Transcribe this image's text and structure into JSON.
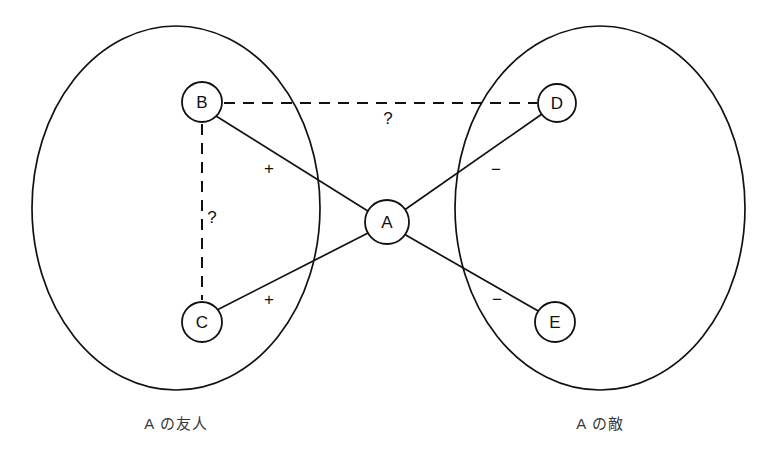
{
  "figure": {
    "background_color": "#ffffff",
    "stroke_color": "#111111"
  },
  "groups": [
    {
      "id": "friends",
      "caption": "A の友人",
      "caption_x": 176,
      "caption_y": 423,
      "ellipse": {
        "cx": 176,
        "cy": 208,
        "rx": 144,
        "ry": 182
      }
    },
    {
      "id": "enemies",
      "caption": "A の敵",
      "caption_x": 600,
      "caption_y": 423,
      "ellipse": {
        "cx": 600,
        "cy": 208,
        "rx": 145,
        "ry": 182
      }
    }
  ],
  "nodes": [
    {
      "id": "A",
      "label": "A",
      "x": 387,
      "y": 222,
      "r": 22
    },
    {
      "id": "B",
      "label": "B",
      "x": 202,
      "y": 102,
      "r": 20
    },
    {
      "id": "C",
      "label": "C",
      "x": 202,
      "y": 322,
      "r": 20
    },
    {
      "id": "D",
      "label": "D",
      "x": 557,
      "y": 103,
      "r": 19
    },
    {
      "id": "E",
      "label": "E",
      "x": 555,
      "y": 322,
      "r": 20
    }
  ],
  "edges": [
    {
      "id": "B-A",
      "from": "B",
      "to": "A",
      "style": "solid",
      "sign": "+",
      "sign_x": 269,
      "sign_y": 168,
      "x1": 216,
      "y1": 116,
      "x2": 371,
      "y2": 213
    },
    {
      "id": "C-A",
      "from": "C",
      "to": "A",
      "style": "solid",
      "sign": "+",
      "sign_x": 269,
      "sign_y": 299,
      "x1": 217,
      "y1": 310,
      "x2": 370,
      "y2": 232
    },
    {
      "id": "A-D",
      "from": "A",
      "to": "D",
      "style": "solid",
      "sign": "−",
      "sign_x": 496,
      "sign_y": 169,
      "x1": 403,
      "y1": 211,
      "x2": 542,
      "y2": 114
    },
    {
      "id": "A-E",
      "from": "A",
      "to": "E",
      "style": "solid",
      "sign": "−",
      "sign_x": 497,
      "sign_y": 299,
      "x1": 404,
      "y1": 234,
      "x2": 540,
      "y2": 312
    },
    {
      "id": "B-D",
      "from": "B",
      "to": "D",
      "style": "dashed",
      "sign": "?",
      "sign_x": 388,
      "sign_y": 118,
      "x1": 224,
      "y1": 103,
      "x2": 537,
      "y2": 103
    },
    {
      "id": "B-C",
      "from": "B",
      "to": "C",
      "style": "dashed",
      "sign": "?",
      "sign_x": 212,
      "sign_y": 217,
      "x1": 202,
      "y1": 124,
      "x2": 202,
      "y2": 300
    }
  ]
}
